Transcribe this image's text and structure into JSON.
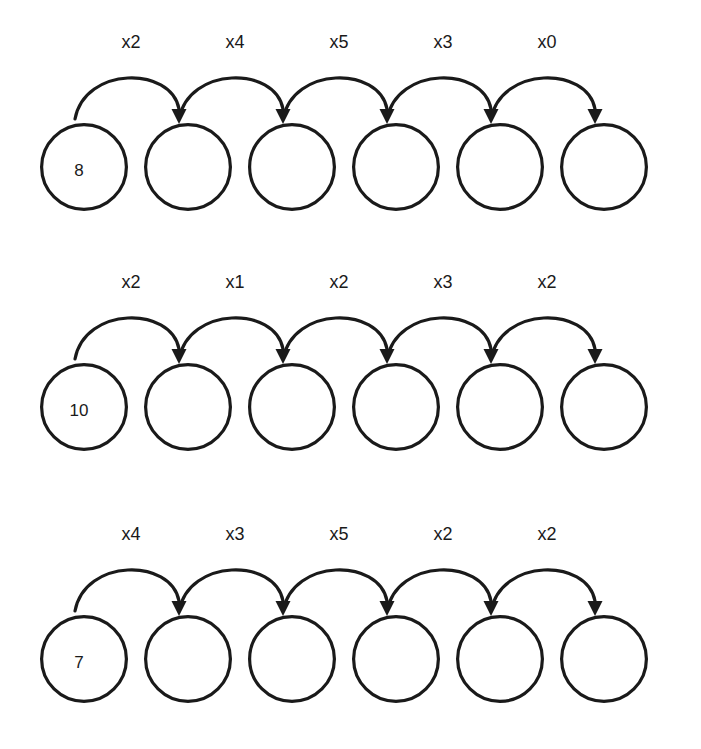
{
  "page": {
    "type": "function-machine-chain-worksheet",
    "background_color": "#ffffff",
    "ink_color": "#1a1a1a",
    "rows_count": 3,
    "circles_per_row": 6,
    "arrows_per_row": 5
  },
  "rows": [
    {
      "id": "row-1",
      "start_value": "8",
      "cells": [
        "8",
        "",
        "",
        "",
        "",
        ""
      ],
      "arrow_labels": [
        "x2",
        "x4",
        "x5",
        "x3",
        "x0"
      ]
    },
    {
      "id": "row-2",
      "start_value": "10",
      "cells": [
        "10",
        "",
        "",
        "",
        "",
        ""
      ],
      "arrow_labels": [
        "x2",
        "x1",
        "x2",
        "x3",
        "x2"
      ]
    },
    {
      "id": "row-3",
      "start_value": "7",
      "cells": [
        "7",
        "",
        "",
        "",
        "",
        ""
      ],
      "arrow_labels": [
        "x4",
        "x3",
        "x5",
        "x2",
        "x2"
      ]
    }
  ],
  "geometry": {
    "circle_diameter": 88,
    "circle_pitch": 104,
    "first_circle_left": 40,
    "row_tops": [
      18,
      258,
      510
    ],
    "row_height": 220
  }
}
